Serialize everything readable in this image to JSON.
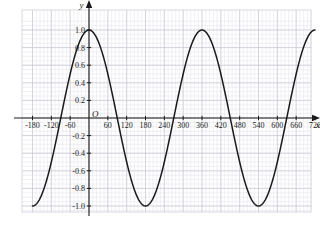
{
  "chart_data": {
    "type": "line",
    "title": "",
    "xlabel": "x",
    "ylabel": "y",
    "function": "y = cos(x)",
    "origin_label": "O",
    "xlim": [
      -180,
      720
    ],
    "ylim": [
      -1.12,
      1.12
    ],
    "grid": true,
    "grid_minor": true,
    "legend": "none",
    "x_tick_labels": [
      "-180",
      "-120",
      "-60",
      "60",
      "120",
      "180",
      "240",
      "300",
      "360",
      "420",
      "480",
      "540",
      "600",
      "660",
      "720"
    ],
    "x_tick_values": [
      -180,
      -120,
      -60,
      60,
      120,
      180,
      240,
      300,
      360,
      420,
      480,
      540,
      600,
      660,
      720
    ],
    "y_tick_labels": [
      "1.0",
      "0.8",
      "0.6",
      "0.4",
      "0.2",
      "-0.2",
      "-0.4",
      "-0.6",
      "-0.8",
      "-1.0"
    ],
    "y_tick_values": [
      1.0,
      0.8,
      0.6,
      0.4,
      0.2,
      -0.2,
      -0.4,
      -0.6,
      -0.8,
      -1.0
    ],
    "x_major_step": 60,
    "y_major_step": 0.2,
    "series": [
      {
        "name": "y = cos(x)",
        "color": "#1a1a1a",
        "x": [
          -180,
          -175,
          -170,
          -165,
          -160,
          -155,
          -150,
          -145,
          -140,
          -135,
          -130,
          -125,
          -120,
          -115,
          -110,
          -105,
          -100,
          -95,
          -90,
          -85,
          -80,
          -75,
          -70,
          -65,
          -60,
          -55,
          -50,
          -45,
          -40,
          -35,
          -30,
          -25,
          -20,
          -15,
          -10,
          -5,
          0,
          5,
          10,
          15,
          20,
          25,
          30,
          35,
          40,
          45,
          50,
          55,
          60,
          65,
          70,
          75,
          80,
          85,
          90,
          95,
          100,
          105,
          110,
          115,
          120,
          125,
          130,
          135,
          140,
          145,
          150,
          155,
          160,
          165,
          170,
          175,
          180,
          185,
          190,
          195,
          200,
          205,
          210,
          215,
          220,
          225,
          230,
          235,
          240,
          245,
          250,
          255,
          260,
          265,
          270,
          275,
          280,
          285,
          290,
          295,
          300,
          305,
          310,
          315,
          320,
          325,
          330,
          335,
          340,
          345,
          350,
          355,
          360,
          365,
          370,
          375,
          380,
          385,
          390,
          395,
          400,
          405,
          410,
          415,
          420,
          425,
          430,
          435,
          440,
          445,
          450,
          455,
          460,
          465,
          470,
          475,
          480,
          485,
          490,
          495,
          500,
          505,
          510,
          515,
          520,
          525,
          530,
          535,
          540,
          545,
          550,
          555,
          560,
          565,
          570,
          575,
          580,
          585,
          590,
          595,
          600,
          605,
          610,
          615,
          620,
          625,
          630,
          635,
          640,
          645,
          650,
          655,
          660,
          665,
          670,
          675,
          680,
          685,
          690,
          695,
          700,
          705,
          710,
          715,
          720
        ],
        "y_formula": "cos(x_degrees)"
      }
    ],
    "key_points": [
      {
        "x": -180,
        "y": -1.0,
        "type": "minimum"
      },
      {
        "x": -90,
        "y": 0.0,
        "type": "zero-crossing"
      },
      {
        "x": 0,
        "y": 1.0,
        "type": "maximum"
      },
      {
        "x": 90,
        "y": 0.0,
        "type": "zero-crossing"
      },
      {
        "x": 180,
        "y": -1.0,
        "type": "minimum"
      },
      {
        "x": 270,
        "y": 0.0,
        "type": "zero-crossing"
      },
      {
        "x": 360,
        "y": 1.0,
        "type": "maximum"
      },
      {
        "x": 450,
        "y": 0.0,
        "type": "zero-crossing"
      },
      {
        "x": 540,
        "y": -1.0,
        "type": "minimum"
      },
      {
        "x": 630,
        "y": 0.0,
        "type": "zero-crossing"
      },
      {
        "x": 720,
        "y": 1.0,
        "type": "maximum"
      }
    ],
    "colors": {
      "curve": "#1a1a1a",
      "axis": "#1a1a1a",
      "grid_major": "#c9c9d4",
      "grid_minor": "#e6e6ee",
      "background": "#ffffff"
    }
  }
}
